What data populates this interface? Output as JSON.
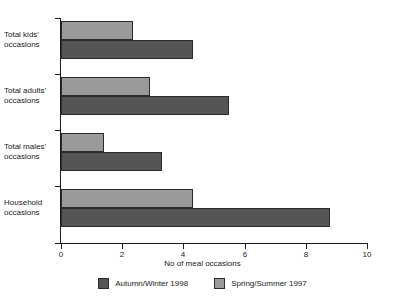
{
  "chart_data": {
    "type": "bar",
    "orientation": "horizontal",
    "title": "",
    "xlabel": "No of meal occasions",
    "ylabel": "",
    "xlim": [
      0,
      10
    ],
    "xticks": [
      0,
      2,
      4,
      6,
      8,
      10
    ],
    "xtick_labels": [
      "0",
      "2",
      "4",
      "6",
      "8",
      "10"
    ],
    "grid": false,
    "legend_position": "bottom",
    "categories": [
      "Total kids' occasions",
      "Total adults' occasions",
      "Total males' occasions",
      "Household occasions"
    ],
    "category_lines": [
      [
        "Total kids'",
        "occasions"
      ],
      [
        "Total adults'",
        "occasions"
      ],
      [
        "Total males'",
        "occasions"
      ],
      [
        "Household",
        "occasions"
      ]
    ],
    "series": [
      {
        "name": "Autumn/Winter 1998",
        "color": "#555555",
        "values": [
          4.3,
          5.5,
          3.3,
          8.8
        ]
      },
      {
        "name": "Spring/Summer 1997",
        "color": "#9a9a9a",
        "values": [
          2.35,
          2.9,
          1.4,
          4.3
        ]
      }
    ]
  },
  "legend": {
    "entries": [
      {
        "label": "Autumn/Winter 1998",
        "swatch": "dark"
      },
      {
        "label": "Spring/Summer 1997",
        "swatch": "light"
      }
    ]
  }
}
